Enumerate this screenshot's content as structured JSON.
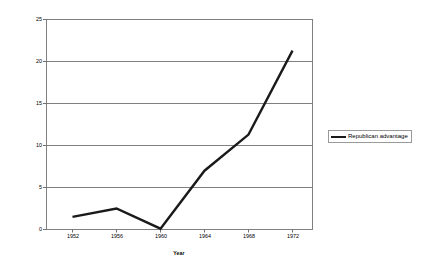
{
  "chart_data": {
    "type": "line",
    "title": "",
    "subtitle": "",
    "xlabel": "Year",
    "ylabel": "Millions of dollars",
    "categories": [
      "1952",
      "1956",
      "1960",
      "1964",
      "1968",
      "1972"
    ],
    "x": [
      1952,
      1956,
      1960,
      1964,
      1968,
      1972
    ],
    "series": [
      {
        "name": "Republican advantage",
        "values": [
          1.5,
          2.5,
          0.1,
          7.0,
          11.3,
          21.3
        ],
        "color": "#1a1a1a"
      }
    ],
    "values": [
      1.5,
      2.5,
      0.1,
      7.0,
      11.3,
      21.3
    ],
    "ylim": [
      0,
      25
    ],
    "xlim": [
      1950,
      1974
    ],
    "yticks": [
      0,
      5,
      10,
      15,
      20,
      25
    ],
    "ytick_labels": [
      "0",
      "5",
      "10",
      "15",
      "20",
      "25"
    ],
    "xtick_labels": [
      "1952",
      "1956",
      "1960",
      "1964",
      "1968",
      "1972"
    ],
    "grid": "horizontal",
    "grid_color": "#808080",
    "legend_position": "right",
    "legend_entries": [
      "Republican advantage"
    ],
    "plot_border_color": "#808080",
    "background": "#ffffff",
    "annotations": []
  },
  "axes": {
    "y_title": "Millions of dollars",
    "x_title": "Year"
  },
  "legend": {
    "items": [
      {
        "label": "Republican advantage",
        "color": "#1a1a1a"
      }
    ]
  },
  "ticks": {
    "y": [
      {
        "label": "25",
        "value": 25
      },
      {
        "label": "20",
        "value": 20
      },
      {
        "label": "15",
        "value": 15
      },
      {
        "label": "10",
        "value": 10
      },
      {
        "label": "5",
        "value": 5
      },
      {
        "label": "0",
        "value": 0
      }
    ],
    "x": [
      {
        "label": "1952",
        "value": 1952
      },
      {
        "label": "1956",
        "value": 1956
      },
      {
        "label": "1960",
        "value": 1960
      },
      {
        "label": "1964",
        "value": 1964
      },
      {
        "label": "1968",
        "value": 1968
      },
      {
        "label": "1972",
        "value": 1972
      }
    ]
  }
}
